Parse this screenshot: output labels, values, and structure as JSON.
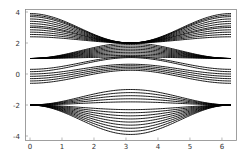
{
  "chart_data": {
    "type": "line",
    "title": "",
    "xlabel": "",
    "ylabel": "",
    "xlim": [
      0,
      6.2832
    ],
    "ylim": [
      -4,
      4
    ],
    "grid": false,
    "legend": null,
    "x_ticks": [
      0,
      1,
      2,
      3,
      4,
      5,
      6
    ],
    "y_ticks": [
      -4,
      -2,
      0,
      2,
      4
    ],
    "line_color": "#000000",
    "families": [
      {
        "name": "top",
        "form": "2 + a*cos^2(x/2)",
        "params": [
          0.4,
          0.55,
          0.7,
          0.85,
          1.0,
          1.1,
          1.25,
          1.4,
          1.55,
          1.7,
          1.8,
          1.9
        ]
      },
      {
        "name": "upper-middle",
        "form": "1 + a*sin^2(x/2)",
        "params": [
          1.0,
          0.9,
          0.8,
          0.7,
          0.6,
          0.5,
          0.4,
          0.3,
          0.2,
          0.1
        ]
      },
      {
        "name": "center",
        "form": "c - a*sin^2(x/2) (crossing)",
        "params": [
          0.3,
          0.15,
          0.0,
          -0.15,
          -0.3,
          -0.45,
          -0.6
        ]
      },
      {
        "name": "bottom",
        "form": "-2 + a*sin^2(x/2)",
        "params": [
          1.0,
          0.8,
          0.6,
          0.4,
          0.2,
          -0.3,
          -0.5,
          -0.7,
          -0.9,
          -1.1,
          -1.3,
          -1.5,
          -1.7,
          -1.9
        ]
      }
    ]
  }
}
